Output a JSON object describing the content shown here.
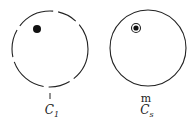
{
  "diagram": {
    "circles": [
      {
        "id": "C1",
        "style": "dashed",
        "point_label": "l",
        "caption_main": "C",
        "caption_sub": "1",
        "marker": "filled-dot"
      },
      {
        "id": "Cs",
        "style": "solid",
        "point_label": "m",
        "caption_main": "C",
        "caption_sub": "s",
        "marker": "ringed-dot"
      }
    ],
    "colors": {
      "stroke": "#222222",
      "background": "#ffffff"
    }
  }
}
